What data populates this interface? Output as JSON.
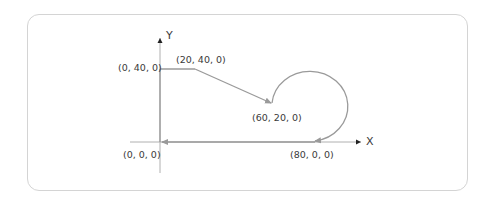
{
  "diagram": {
    "axes": {
      "x_label": "X",
      "y_label": "Y"
    },
    "points": [
      {
        "id": "p0",
        "label": "(0, 40, 0)"
      },
      {
        "id": "p1",
        "label": "(20, 40, 0)"
      },
      {
        "id": "p2",
        "label": "(60, 20, 0)"
      },
      {
        "id": "p3",
        "label": "(80, 0, 0)"
      },
      {
        "id": "p4",
        "label": "(0, 0, 0)"
      }
    ],
    "path_description": "Tool path: (0,40,0) -> (20,40,0) -> linear to (60,20,0) -> counter-clockwise arc to (80,0,0) -> linear to (0,0,0)",
    "colors": {
      "path": "#9a9a9a",
      "axis": "#b0b0b0",
      "arrow": "#222222",
      "frame": "#d4d4d4",
      "text": "#3a3a3a"
    }
  }
}
